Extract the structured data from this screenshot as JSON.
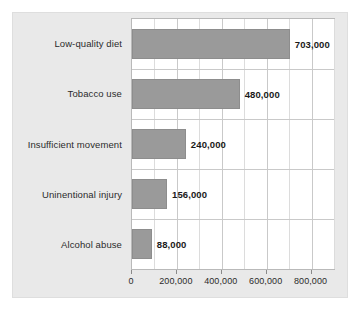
{
  "chart_data": {
    "type": "bar",
    "orientation": "horizontal",
    "title": "",
    "subtitle": "",
    "xlabel": "",
    "ylabel": "",
    "categories": [
      "Low-quality diet",
      "Tobacco use",
      "Insufficient movement",
      "Uninentional injury",
      "Alcohol abuse"
    ],
    "values": [
      703000,
      480000,
      240000,
      156000,
      88000
    ],
    "value_labels": [
      "703,000",
      "480,000",
      "240,000",
      "156,000",
      "88,000"
    ],
    "xlim": [
      0,
      900000
    ],
    "xticks": [
      0,
      200000,
      400000,
      600000,
      800000
    ],
    "xtick_labels": [
      "0",
      "200,000",
      "400,000",
      "600,000",
      "800,000"
    ],
    "minor_gridlines": [
      100000,
      300000,
      500000,
      700000,
      900000
    ],
    "grid": true,
    "legend": "none",
    "colors": {
      "bar_fill": "#9a9a9a",
      "bar_stroke": "#8d8d8d",
      "plot_background": "#ffffff",
      "panel_background": "#e9e9e9",
      "gridline_major": "#c9c9c9",
      "gridline_minor": "#dcdcdc",
      "text": "#2b2b2b",
      "value_text": "#1a1a1a"
    }
  }
}
